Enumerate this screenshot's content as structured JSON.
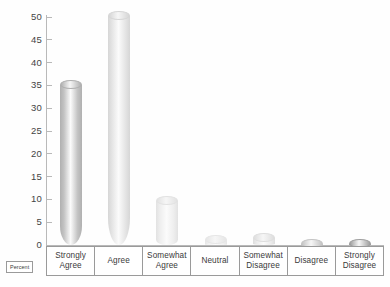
{
  "chart_data": {
    "type": "bar",
    "title": "",
    "xlabel": "",
    "ylabel": "Percent",
    "ylim": [
      0,
      50
    ],
    "ytick_step": 5,
    "grid": false,
    "legend": "none",
    "style": "3d-cylinder",
    "categories": [
      "Strongly Agree",
      "Agree",
      "Somewhat Agree",
      "Neutral",
      "Somewhat Disagree",
      "Disagree",
      "Strongly Disagree"
    ],
    "values": [
      36,
      51,
      10.5,
      2,
      2.5,
      1,
      1
    ],
    "ytick_labels": [
      "0",
      "5",
      "10",
      "15",
      "20",
      "25",
      "30",
      "35",
      "40",
      "45",
      "50"
    ],
    "bar_colors": [
      "#c3c3c3",
      "#e4e4e4",
      "#eeeeee",
      "#f1f1f1",
      "#ececec",
      "#d8d8d8",
      "#b8b8b8"
    ],
    "bar_cap_colors": [
      "#b0b0b0",
      "#d6d6d6",
      "#e2e2e2",
      "#e6e6e6",
      "#dedede",
      "#c4c4c4",
      "#9e9e9e"
    ]
  },
  "axis": {
    "y_label_box": "Percent",
    "axis_color": "#b9b9b9"
  },
  "categories_display": [
    {
      "line1": "Strongly",
      "line2": "Agree"
    },
    {
      "line1": "Agree",
      "line2": ""
    },
    {
      "line1": "Somewhat",
      "line2": "Agree"
    },
    {
      "line1": "Neutral",
      "line2": ""
    },
    {
      "line1": "Somewhat",
      "line2": "Disagree"
    },
    {
      "line1": "Disagree",
      "line2": ""
    },
    {
      "line1": "Strongly",
      "line2": "Disagree"
    }
  ]
}
